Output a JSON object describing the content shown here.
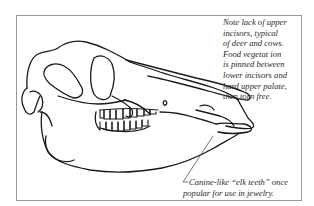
{
  "figure": {
    "annotations": {
      "top": {
        "lines": [
          "Note lack of upper",
          "incisors, typical",
          "of deer and cows.",
          "Food vegetat ion",
          "is pinned between",
          "lower incisors and",
          "hard upper palate,",
          "then torn free."
        ]
      },
      "bottom": {
        "lines": [
          "Canine-like “elk teeth” once",
          "popular for use in jewelry."
        ]
      }
    },
    "colors": {
      "line": "#1a1a1a",
      "frame": "#9a9a9a",
      "text": "#2a2a2a",
      "background": "#ffffff"
    }
  }
}
